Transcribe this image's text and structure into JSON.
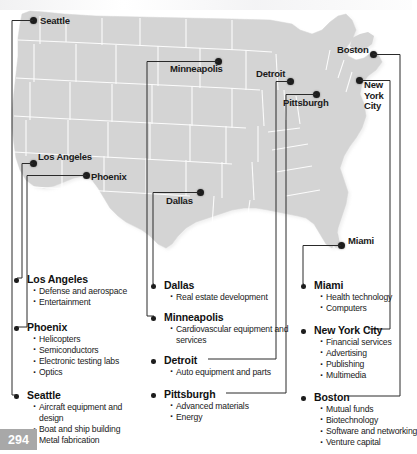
{
  "page": {
    "number": "294"
  },
  "map": {
    "title": "United States industry cluster map",
    "land_color": "#d4d4d4",
    "state_border_color": "#ffffff",
    "dot_color": "#1d1d1d",
    "connector_color": "#2a2a2a",
    "cities": [
      {
        "name": "Seattle",
        "label": "Seattle"
      },
      {
        "name": "Minneapolis",
        "label": "Minneapolis"
      },
      {
        "name": "Detroit",
        "label": "Detroit"
      },
      {
        "name": "Boston",
        "label": "Boston"
      },
      {
        "name": "Pittsburgh",
        "label": "Pittsburgh"
      },
      {
        "name": "New York City",
        "label": "New York City"
      },
      {
        "name": "Los Angeles",
        "label": "Los Angeles"
      },
      {
        "name": "Phoenix",
        "label": "Phoenix"
      },
      {
        "name": "Dallas",
        "label": "Dallas"
      },
      {
        "name": "Miami",
        "label": "Miami"
      }
    ],
    "nyc_line1": "New",
    "nyc_line2": "York",
    "nyc_line3": "City"
  },
  "clusters": {
    "west": [
      {
        "city": "Los Angeles",
        "industries": [
          "Defense and aerospace",
          "Entertainment"
        ]
      },
      {
        "city": "Phoenix",
        "industries": [
          "Helicopters",
          "Semiconductors",
          "Electronic testing labs",
          "Optics"
        ]
      },
      {
        "city": "Seattle",
        "industries": [
          "Aircraft equipment and design",
          "Boat and ship building",
          "Metal fabrication"
        ]
      }
    ],
    "middle": [
      {
        "city": "Dallas",
        "industries": [
          "Real estate development"
        ]
      },
      {
        "city": "Minneapolis",
        "industries": [
          "Cardiovascular equipment and services"
        ]
      },
      {
        "city": "Detroit",
        "industries": [
          "Auto equipment and parts"
        ]
      },
      {
        "city": "Pittsburgh",
        "industries": [
          "Advanced materials",
          "Energy"
        ]
      }
    ],
    "east": [
      {
        "city": "Miami",
        "industries": [
          "Health technology",
          "Computers"
        ]
      },
      {
        "city": "New York City",
        "industries": [
          "Financial services",
          "Advertising",
          "Publishing",
          "Multimedia"
        ]
      },
      {
        "city": "Boston",
        "industries": [
          "Mutual funds",
          "Biotechnology",
          "Software and networking",
          "Venture capital"
        ]
      }
    ]
  }
}
